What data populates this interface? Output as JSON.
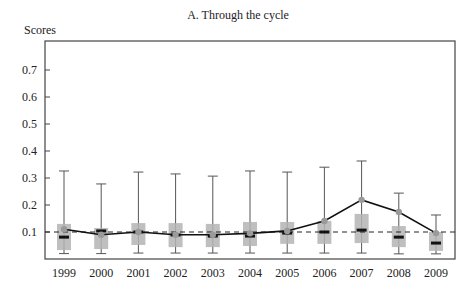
{
  "chart_data": {
    "type": "box",
    "title": "A. Through the cycle",
    "xlabel": "",
    "ylabel": "Scores",
    "ylim": [
      0,
      0.8
    ],
    "yticks": [
      0.1,
      0.2,
      0.3,
      0.4,
      0.5,
      0.6,
      0.7
    ],
    "ytick_labels": [
      "0.1",
      "0.2",
      "0.3",
      "0.4",
      "0.5",
      "0.6",
      "0.7"
    ],
    "categories": [
      "1999",
      "2000",
      "2001",
      "2002",
      "2003",
      "2004",
      "2005",
      "2006",
      "2007",
      "2008",
      "2009"
    ],
    "reference_line": {
      "value": 0.1,
      "style": "dashed"
    },
    "grid": false,
    "series": [
      {
        "name": "whisker_high",
        "values": [
          0.326,
          0.278,
          0.322,
          0.315,
          0.307,
          0.326,
          0.322,
          0.34,
          0.363,
          0.244,
          0.163
        ]
      },
      {
        "name": "q3",
        "values": [
          0.13,
          0.115,
          0.133,
          0.133,
          0.13,
          0.137,
          0.137,
          0.141,
          0.167,
          0.122,
          0.1
        ]
      },
      {
        "name": "median",
        "values": [
          0.081,
          0.104,
          0.1,
          0.089,
          0.085,
          0.085,
          0.096,
          0.1,
          0.107,
          0.081,
          0.059
        ]
      },
      {
        "name": "q1",
        "values": [
          0.033,
          0.037,
          0.052,
          0.044,
          0.044,
          0.048,
          0.056,
          0.056,
          0.059,
          0.044,
          0.03
        ]
      },
      {
        "name": "whisker_low",
        "values": [
          0.02,
          0.02,
          0.022,
          0.022,
          0.022,
          0.022,
          0.022,
          0.022,
          0.022,
          0.019,
          0.019
        ]
      },
      {
        "name": "mean",
        "values": [
          0.11,
          0.09,
          0.1,
          0.09,
          0.09,
          0.095,
          0.104,
          0.141,
          0.219,
          0.174,
          0.096
        ]
      }
    ],
    "colors": {
      "box": "#b4b4b4",
      "median": "#111111",
      "mean_line": "#111111",
      "mean_marker": "#9a9a9a",
      "whisker": "#555555",
      "frame": "#444444"
    }
  }
}
